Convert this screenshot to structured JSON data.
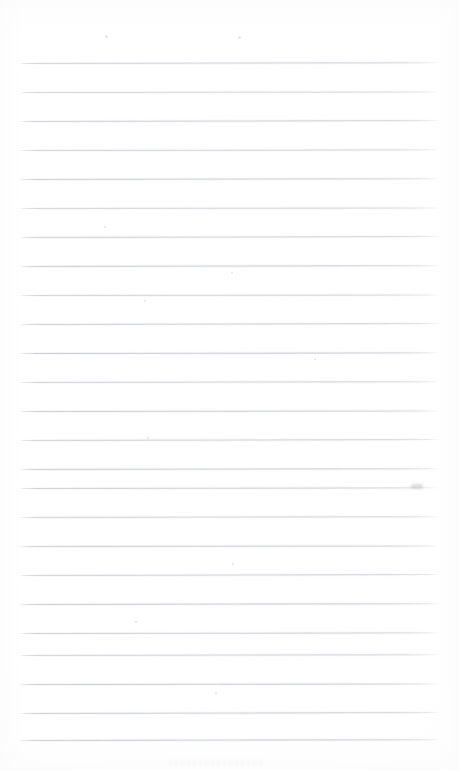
{
  "document": {
    "kind": "scanned-ruled-paper",
    "type": "blank lined notebook page",
    "page_width": 459,
    "page_height": 770,
    "background_color": "#ffffff",
    "rule_color": "#c6c8cd",
    "rule_halo_color": "#d7d9dd",
    "has_visible_text": false,
    "has_handwriting": false,
    "has_margin_rule": false,
    "has_header": false,
    "has_footer": false,
    "title": "",
    "body_text": "",
    "notes": ""
  },
  "ruling": {
    "line_count": 25,
    "first_line_y": 63,
    "line_spacing": 29,
    "line_thickness": 1,
    "left_x": 19,
    "right_x": 440,
    "top_margin_height": 63,
    "bottom_margin_height": 30,
    "lines": [
      {
        "index": 1,
        "y": 63,
        "left": 19,
        "right": 440,
        "tilt_deg": -0.1,
        "opacity": 0.82
      },
      {
        "index": 2,
        "y": 92,
        "left": 19,
        "right": 440,
        "tilt_deg": -0.08,
        "opacity": 0.74
      },
      {
        "index": 3,
        "y": 121,
        "left": 19,
        "right": 440,
        "tilt_deg": -0.12,
        "opacity": 0.86
      },
      {
        "index": 4,
        "y": 150,
        "left": 19,
        "right": 440,
        "tilt_deg": -0.09,
        "opacity": 0.8
      },
      {
        "index": 5,
        "y": 179,
        "left": 19,
        "right": 440,
        "tilt_deg": -0.11,
        "opacity": 0.88
      },
      {
        "index": 6,
        "y": 208,
        "left": 19,
        "right": 440,
        "tilt_deg": -0.07,
        "opacity": 0.78
      },
      {
        "index": 7,
        "y": 237,
        "left": 19,
        "right": 440,
        "tilt_deg": -0.12,
        "opacity": 0.84
      },
      {
        "index": 8,
        "y": 266,
        "left": 19,
        "right": 440,
        "tilt_deg": -0.1,
        "opacity": 0.9
      },
      {
        "index": 9,
        "y": 295,
        "left": 19,
        "right": 440,
        "tilt_deg": -0.08,
        "opacity": 0.8
      },
      {
        "index": 10,
        "y": 324,
        "left": 19,
        "right": 440,
        "tilt_deg": -0.13,
        "opacity": 0.86
      },
      {
        "index": 11,
        "y": 353,
        "left": 19,
        "right": 440,
        "tilt_deg": -0.09,
        "opacity": 0.92
      },
      {
        "index": 12,
        "y": 382,
        "left": 19,
        "right": 440,
        "tilt_deg": -0.11,
        "opacity": 0.82
      },
      {
        "index": 13,
        "y": 411,
        "left": 19,
        "right": 440,
        "tilt_deg": -0.08,
        "opacity": 0.88
      },
      {
        "index": 14,
        "y": 440,
        "left": 19,
        "right": 440,
        "tilt_deg": -0.12,
        "opacity": 0.84
      },
      {
        "index": 15,
        "y": 469,
        "left": 19,
        "right": 440,
        "tilt_deg": -0.1,
        "opacity": 0.9
      },
      {
        "index": 16,
        "y": 488,
        "left": 19,
        "right": 440,
        "tilt_deg": -0.09,
        "opacity": 0.86
      },
      {
        "index": 17,
        "y": 517,
        "left": 19,
        "right": 440,
        "tilt_deg": -0.11,
        "opacity": 0.8
      },
      {
        "index": 18,
        "y": 546,
        "left": 19,
        "right": 440,
        "tilt_deg": -0.08,
        "opacity": 0.88
      },
      {
        "index": 19,
        "y": 575,
        "left": 19,
        "right": 440,
        "tilt_deg": -0.12,
        "opacity": 0.84
      },
      {
        "index": 20,
        "y": 604,
        "left": 19,
        "right": 440,
        "tilt_deg": -0.1,
        "opacity": 0.92
      },
      {
        "index": 21,
        "y": 633,
        "left": 19,
        "right": 440,
        "tilt_deg": -0.09,
        "opacity": 0.86
      },
      {
        "index": 22,
        "y": 655,
        "left": 19,
        "right": 440,
        "tilt_deg": -0.11,
        "opacity": 0.82
      },
      {
        "index": 23,
        "y": 684,
        "left": 19,
        "right": 440,
        "tilt_deg": -0.08,
        "opacity": 0.9
      },
      {
        "index": 24,
        "y": 713,
        "left": 19,
        "right": 440,
        "tilt_deg": -0.12,
        "opacity": 0.88
      },
      {
        "index": 25,
        "y": 740,
        "left": 19,
        "right": 440,
        "tilt_deg": -0.1,
        "opacity": 0.92
      }
    ]
  },
  "artifacts": {
    "smudges": [
      {
        "x": 411,
        "y": 484,
        "width": 12,
        "height": 5
      }
    ],
    "specks": [
      {
        "x": 105,
        "y": 35,
        "size": 3
      },
      {
        "x": 238,
        "y": 36,
        "size": 3
      },
      {
        "x": 104,
        "y": 226,
        "size": 2
      },
      {
        "x": 231,
        "y": 272,
        "size": 2
      },
      {
        "x": 144,
        "y": 300,
        "size": 2
      },
      {
        "x": 314,
        "y": 358,
        "size": 2
      },
      {
        "x": 147,
        "y": 437,
        "size": 2
      },
      {
        "x": 232,
        "y": 563,
        "size": 2
      },
      {
        "x": 135,
        "y": 621,
        "size": 2
      },
      {
        "x": 215,
        "y": 692,
        "size": 2
      }
    ],
    "bottom_noise": {
      "x": 168,
      "y": 760,
      "width": 96,
      "height": 7
    }
  }
}
